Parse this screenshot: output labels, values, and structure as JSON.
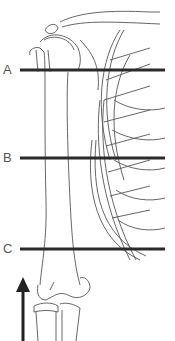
{
  "diagram": {
    "section_lines": [
      {
        "label": "A",
        "y": 70
      },
      {
        "label": "B",
        "y": 158
      },
      {
        "label": "C",
        "y": 249
      }
    ],
    "arrow": {
      "direction": "up",
      "color": "#222222"
    },
    "colors": {
      "outline": "#444444",
      "section_line": "#2a2a2a",
      "label": "#555555",
      "background": "#ffffff"
    }
  }
}
